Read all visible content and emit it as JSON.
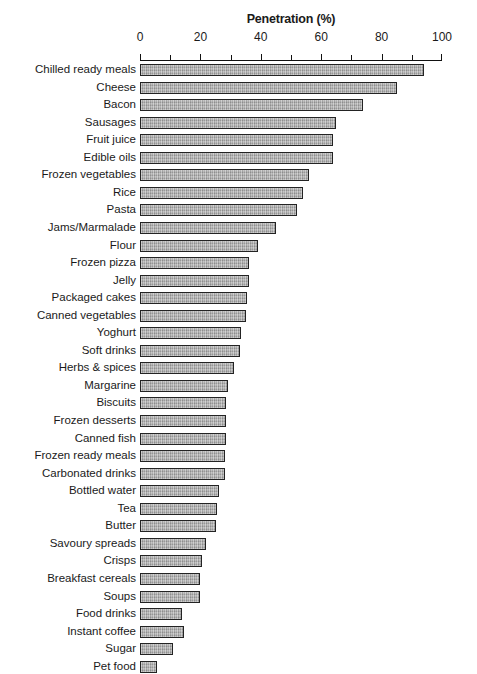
{
  "chart_data": {
    "type": "bar",
    "orientation": "horizontal",
    "title": "Penetration (%)",
    "xlabel": "Penetration (%)",
    "ylabel": "",
    "xlim": [
      0,
      100
    ],
    "xticks": [
      0,
      20,
      40,
      60,
      80,
      100
    ],
    "xtick_labels": [
      "0",
      "20",
      "40",
      "60",
      "80",
      "100"
    ],
    "minor_tick_step": 10,
    "grid": false,
    "legend": null,
    "bar_fill_color": "#a9a9a9",
    "bar_edge_color": "#232323",
    "categories": [
      "Chilled ready meals",
      "Cheese",
      "Bacon",
      "Sausages",
      "Fruit juice",
      "Edible oils",
      "Frozen vegetables",
      "Rice",
      "Pasta",
      "Jams/Marmalade",
      "Flour",
      "Frozen pizza",
      "Jelly",
      "Packaged cakes",
      "Canned vegetables",
      "Yoghurt",
      "Soft drinks",
      "Herbs & spices",
      "Margarine",
      "Biscuits",
      "Frozen desserts",
      "Canned fish",
      "Frozen ready meals",
      "Carbonated drinks",
      "Bottled water",
      "Tea",
      "Butter",
      "Savoury spreads",
      "Crisps",
      "Breakfast cereals",
      "Soups",
      "Food drinks",
      "Instant coffee",
      "Sugar",
      "Pet food"
    ],
    "values": [
      94,
      85,
      74,
      65,
      64,
      64,
      56,
      54,
      52,
      45,
      39,
      36,
      36,
      35.5,
      35,
      33.5,
      33,
      31,
      29,
      28.5,
      28.5,
      28.5,
      28,
      28,
      26,
      25.5,
      25,
      22,
      20.5,
      20,
      20,
      14,
      14.5,
      11,
      5.5
    ]
  }
}
